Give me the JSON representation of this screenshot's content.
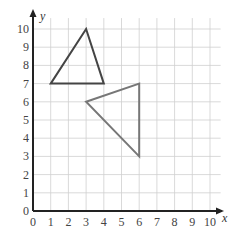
{
  "chart_data": {
    "type": "line",
    "title": "",
    "xlabel": "x",
    "ylabel": "y",
    "xlim": [
      0,
      10
    ],
    "ylim": [
      0,
      10
    ],
    "x_ticks": [
      "0",
      "1",
      "2",
      "3",
      "4",
      "5",
      "6",
      "7",
      "8",
      "9",
      "10"
    ],
    "y_ticks": [
      "0",
      "1",
      "2",
      "3",
      "4",
      "5",
      "6",
      "7",
      "8",
      "9",
      "10"
    ],
    "grid": true,
    "series": [
      {
        "name": "triangle-A",
        "color": "#444444",
        "points": [
          [
            1,
            7
          ],
          [
            3,
            10
          ],
          [
            4,
            7
          ]
        ],
        "closed": true
      },
      {
        "name": "triangle-B",
        "color": "#777777",
        "points": [
          [
            3,
            6
          ],
          [
            6,
            7
          ],
          [
            6,
            3
          ]
        ],
        "closed": true
      }
    ]
  },
  "colors": {
    "grid": "#cfcfcf",
    "axis": "#222222"
  }
}
